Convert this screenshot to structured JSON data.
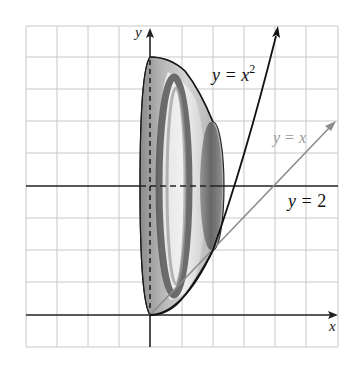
{
  "figure": {
    "axes": {
      "x_label": "x",
      "y_label": "y"
    },
    "curves": [
      {
        "name": "parabola",
        "label_var": "y = x",
        "label_exp": "2",
        "color": "#111111"
      },
      {
        "name": "line",
        "label": "y = x",
        "color": "#8c8c8c"
      },
      {
        "name": "axis-of-rotation",
        "label_var": "y = ",
        "label_num": "2",
        "color": "#111111"
      }
    ],
    "colors": {
      "grid": "#c8c8c8",
      "axis": "#222222",
      "solid_outer": "#9a9a9a",
      "solid_light": "#d9d9d9",
      "ring_dark": "#555555",
      "end_cap": "#6e6e6e"
    }
  }
}
